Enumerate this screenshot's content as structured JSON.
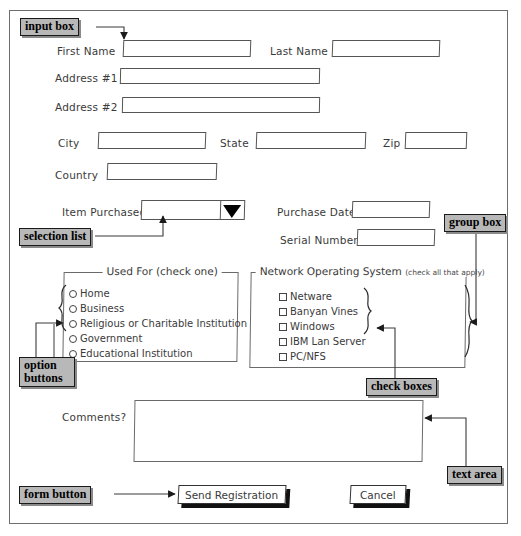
{
  "form": {
    "title": "Registration Form Mockup",
    "fields": [
      {
        "label": "First Name",
        "name": "first-name"
      },
      {
        "label": "Last Name",
        "name": "last-name"
      },
      {
        "label": "Address #1",
        "name": "address-1"
      },
      {
        "label": "Address #2",
        "name": "address-2"
      },
      {
        "label": "City",
        "name": "city"
      },
      {
        "label": "State",
        "name": "state"
      },
      {
        "label": "Zip",
        "name": "zip"
      },
      {
        "label": "Country",
        "name": "country"
      },
      {
        "label": "Item Purchased",
        "name": "item-purchased"
      },
      {
        "label": "Purchase Date",
        "name": "purchase-date"
      },
      {
        "label": "Serial Number",
        "name": "serial-number"
      },
      {
        "label": "Comments?",
        "name": "comments"
      }
    ],
    "values": {
      "first_name": "",
      "last_name": "",
      "address_1": "",
      "address_2": "",
      "city": "",
      "state": "",
      "zip": "",
      "country": "",
      "item_purchased": "",
      "purchase_date": "",
      "serial_number": "",
      "comments": ""
    },
    "used_for_group": {
      "title_main": "Used For",
      "title_hint": "(check one)",
      "options": [
        "Home",
        "Business",
        "Religious or Charitable Institution",
        "Government",
        "Educational Institution"
      ]
    },
    "network_group": {
      "title_main": "Network Operating System",
      "title_hint": "(check all that apply)",
      "options": [
        "Netware",
        "Banyan Vines",
        "Windows",
        "IBM Lan Server",
        "PC/NFS"
      ]
    },
    "buttons": {
      "submit": "Send Registration",
      "cancel": "Cancel"
    }
  },
  "annotations": {
    "input_box": "input box",
    "selection_list": "selection list",
    "group_box": "group box",
    "option_buttons_line1": "option",
    "option_buttons_line2": "buttons",
    "check_boxes": "check boxes",
    "text_area": "text area",
    "form_button": "form button"
  },
  "colors": {
    "callout_fill": "#b8b8b8",
    "callout_border": "#1a1a1a",
    "ink": "#3a3a3a",
    "field_border": "#555555",
    "page_bg": "#ffffff",
    "button_shadow": "#111111"
  },
  "icons": {
    "dropdown": "dropdown-arrow-icon",
    "radio": "radio-button-icon",
    "checkbox": "checkbox-icon",
    "arrow": "leader-arrow-icon"
  }
}
